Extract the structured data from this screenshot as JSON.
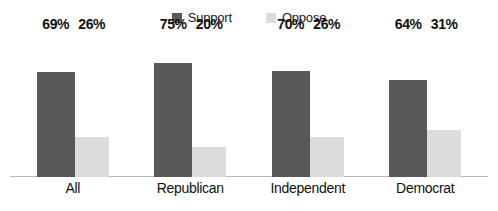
{
  "chart_data": {
    "type": "bar",
    "title": "",
    "subtitle": "",
    "xlabel": "",
    "ylabel": "",
    "ylim": [
      0,
      100
    ],
    "grid": false,
    "legend_position": "top-center",
    "categories": [
      "All",
      "Republican",
      "Independent",
      "Democrat"
    ],
    "series": [
      {
        "name": "Support",
        "color": "#58585a",
        "values": [
          69,
          75,
          70,
          64
        ],
        "labels": [
          "69%",
          "75%",
          "70%",
          "64%"
        ]
      },
      {
        "name": "Oppose",
        "color": "#dcdcdc",
        "values": [
          26,
          20,
          26,
          31
        ],
        "labels": [
          "26%",
          "20%",
          "26%",
          "31%"
        ]
      }
    ]
  },
  "legend": {
    "items": [
      {
        "label": "Support",
        "color": "#58585a"
      },
      {
        "label": "Oppose",
        "color": "#dcdcdc"
      }
    ]
  },
  "axis": {
    "baseline_color": "#b9b9b9"
  },
  "groups": [
    {
      "category": "All",
      "support_label": "69%",
      "oppose_label": "26%",
      "support_value": 69,
      "oppose_value": 26
    },
    {
      "category": "Republican",
      "support_label": "75%",
      "oppose_label": "20%",
      "support_value": 75,
      "oppose_value": 20
    },
    {
      "category": "Independent",
      "support_label": "70%",
      "oppose_label": "26%",
      "support_value": 70,
      "oppose_value": 26
    },
    {
      "category": "Democrat",
      "support_label": "64%",
      "oppose_label": "31%",
      "support_value": 64,
      "oppose_value": 31
    }
  ]
}
